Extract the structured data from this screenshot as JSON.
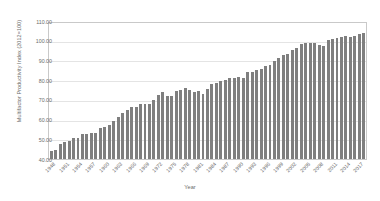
{
  "chart_data": {
    "type": "bar",
    "title": "",
    "xlabel": "Year",
    "ylabel": "Multifactor Productivity Index (2012=100)",
    "ylim": [
      40.0,
      110.0
    ],
    "ytick_step": 10.0,
    "yticks": [
      "40.00",
      "50.00",
      "60.00",
      "70.00",
      "80.00",
      "90.00",
      "100.00",
      "110.00"
    ],
    "ytick_values": [
      40,
      50,
      60,
      70,
      80,
      90,
      100,
      110
    ],
    "grid": true,
    "legend": "none",
    "bar_color": "#7f7f7f",
    "xtick_labels": [
      "1948",
      "1951",
      "1954",
      "1957",
      "1960",
      "1963",
      "1966",
      "1969",
      "1972",
      "1975",
      "1978",
      "1981",
      "1984",
      "1987",
      "1990",
      "1993",
      "1996",
      "1999",
      "2002",
      "2005",
      "2008",
      "2011",
      "2014",
      "2017"
    ],
    "xtick_interval_years": 3,
    "categories": [
      "1948",
      "1949",
      "1950",
      "1951",
      "1952",
      "1953",
      "1954",
      "1955",
      "1956",
      "1957",
      "1958",
      "1959",
      "1960",
      "1961",
      "1962",
      "1963",
      "1964",
      "1965",
      "1966",
      "1967",
      "1968",
      "1969",
      "1970",
      "1971",
      "1972",
      "1973",
      "1974",
      "1975",
      "1976",
      "1977",
      "1978",
      "1979",
      "1980",
      "1981",
      "1982",
      "1983",
      "1984",
      "1985",
      "1986",
      "1987",
      "1988",
      "1989",
      "1990",
      "1991",
      "1992",
      "1993",
      "1994",
      "1995",
      "1996",
      "1997",
      "1998",
      "1999",
      "2000",
      "2001",
      "2002",
      "2003",
      "2004",
      "2005",
      "2006",
      "2007",
      "2008",
      "2009",
      "2010",
      "2011",
      "2012",
      "2013",
      "2014",
      "2015",
      "2016",
      "2017",
      "2018"
    ],
    "values": [
      44.2,
      44.8,
      47.6,
      48.8,
      49.3,
      50.6,
      50.6,
      53.0,
      52.7,
      53.5,
      53.4,
      55.9,
      56.3,
      57.5,
      59.6,
      61.4,
      63.5,
      65.4,
      66.8,
      66.9,
      68.5,
      68.5,
      68.1,
      70.4,
      72.7,
      74.5,
      72.2,
      72.3,
      74.8,
      75.6,
      76.5,
      75.7,
      74.3,
      75.1,
      73.3,
      75.9,
      78.5,
      79.2,
      80.3,
      80.5,
      81.5,
      81.8,
      82.1,
      81.8,
      84.6,
      84.9,
      85.8,
      86.1,
      87.7,
      88.6,
      90.2,
      91.9,
      93.5,
      93.9,
      95.9,
      97.3,
      99.0,
      99.5,
      99.5,
      99.9,
      98.5,
      98.3,
      101.3,
      101.6,
      102.2,
      102.6,
      103.1,
      103.0,
      103.1,
      104.1,
      104.9
    ]
  }
}
